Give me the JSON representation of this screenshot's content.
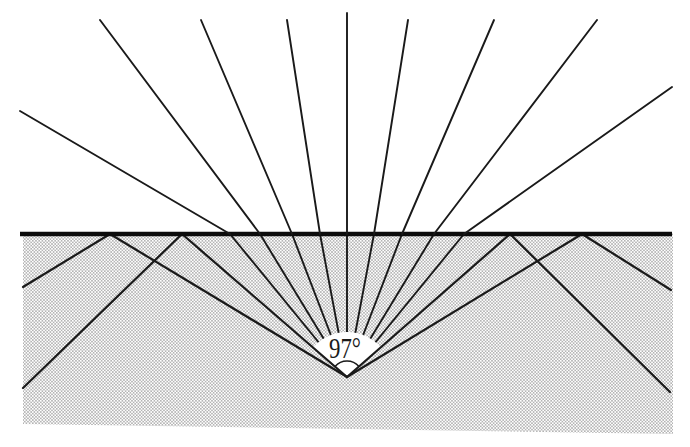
{
  "figure": {
    "type": "optics-ray-diagram",
    "description_label": "97°",
    "cone_full_angle_deg": 97,
    "canvas": {
      "w": 690,
      "h": 447
    },
    "colors": {
      "background": "#ffffff",
      "ink": "#1a1a1a",
      "surface_line": "#0c0c0c",
      "stipple_dot": "#8f8f8f"
    },
    "apex": {
      "x": 347,
      "y": 377
    },
    "surface": {
      "y": 234,
      "x_left": 20,
      "x_right": 672,
      "thickness": 4.6
    },
    "water_polygon": [
      [
        23,
        232
      ],
      [
        673,
        232
      ],
      [
        673,
        434
      ],
      [
        23,
        424
      ]
    ],
    "source_sector": {
      "radius": 45,
      "half_angle_deg": 48.5
    },
    "angle_marker": {
      "label": "97°",
      "radius": 16,
      "half_angle_deg": 48.5,
      "label_x": 345,
      "label_y": 358,
      "font_size": 30,
      "text_length": 32
    },
    "ray_widths": {
      "thin": 1.9,
      "thick": 2.2
    },
    "underwater_fan_surface_x": [
      230,
      260,
      292,
      320,
      347,
      374,
      402,
      434,
      464
    ],
    "critical_edge_surface_x": [
      182,
      510
    ],
    "tir_incident_surface_x": [
      110,
      582
    ],
    "reflected_rays": [
      {
        "x_vertex": 182,
        "x_end": 23,
        "y_end": 388
      },
      {
        "x_vertex": 110,
        "x_end": 23,
        "y_end": 287
      },
      {
        "x_vertex": 510,
        "x_end": 670,
        "y_end": 392
      },
      {
        "x_vertex": 582,
        "x_end": 671,
        "y_end": 290
      }
    ],
    "refracted_rays": [
      {
        "x_surface": 230,
        "x_end": 20,
        "y_end": 111
      },
      {
        "x_surface": 260,
        "x_end": 100,
        "y_end": 20
      },
      {
        "x_surface": 292,
        "x_end": 201,
        "y_end": 20
      },
      {
        "x_surface": 320,
        "x_end": 287,
        "y_end": 20
      },
      {
        "x_surface": 347,
        "x_end": 347,
        "y_end": 13
      },
      {
        "x_surface": 374,
        "x_end": 408,
        "y_end": 20
      },
      {
        "x_surface": 402,
        "x_end": 494,
        "y_end": 20
      },
      {
        "x_surface": 434,
        "x_end": 597,
        "y_end": 20
      },
      {
        "x_surface": 464,
        "x_end": 672,
        "y_end": 87
      }
    ]
  }
}
